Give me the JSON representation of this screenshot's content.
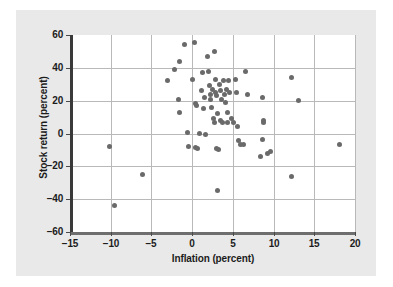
{
  "chart_data": {
    "type": "scatter",
    "title": "",
    "xlabel": "Inflation (percent)",
    "ylabel": "Stock return (percent)",
    "xlim": [
      -15,
      20
    ],
    "ylim": [
      -60,
      60
    ],
    "xticks": [
      -15,
      -10,
      -5,
      0,
      5,
      10,
      15,
      20
    ],
    "yticks": [
      -60,
      -40,
      -20,
      0,
      20,
      40,
      60
    ],
    "xtick_labels": [
      "−15",
      "−10",
      "−5",
      "0",
      "5",
      "10",
      "15",
      "20"
    ],
    "ytick_labels": [
      "60",
      "40",
      "20",
      "0",
      "−20",
      "−40",
      "−60"
    ],
    "grid": true,
    "legend": null,
    "marker_color": "#6a6a6a",
    "plot_background": "#ffffff",
    "figure_background": "#e9e9e9",
    "points": [
      [
        -10.1,
        -8
      ],
      [
        -9.5,
        -44
      ],
      [
        -6.1,
        -25
      ],
      [
        -3.0,
        32
      ],
      [
        -2.2,
        39
      ],
      [
        -1.6,
        44
      ],
      [
        -1.7,
        20.5
      ],
      [
        -1.5,
        13
      ],
      [
        -0.9,
        54
      ],
      [
        -0.6,
        0.5
      ],
      [
        -0.5,
        -8
      ],
      [
        0.1,
        33
      ],
      [
        0.3,
        55.5
      ],
      [
        0.4,
        18.5
      ],
      [
        0.5,
        17
      ],
      [
        0.4,
        -8.5
      ],
      [
        0.7,
        -9
      ],
      [
        0.9,
        0
      ],
      [
        1.1,
        26
      ],
      [
        1.3,
        37
      ],
      [
        1.5,
        22
      ],
      [
        1.4,
        15
      ],
      [
        1.6,
        -0.5
      ],
      [
        1.9,
        47
      ],
      [
        2.0,
        38
      ],
      [
        2.1,
        29
      ],
      [
        2.2,
        24
      ],
      [
        2.3,
        20.5
      ],
      [
        2.4,
        16
      ],
      [
        2.5,
        27
      ],
      [
        2.6,
        9
      ],
      [
        2.7,
        7
      ],
      [
        2.8,
        50
      ],
      [
        2.9,
        33
      ],
      [
        2.9,
        25
      ],
      [
        3.0,
        23
      ],
      [
        3.1,
        12
      ],
      [
        3.0,
        -9
      ],
      [
        3.2,
        -9.5
      ],
      [
        3.1,
        -35
      ],
      [
        3.4,
        30
      ],
      [
        3.5,
        26
      ],
      [
        3.6,
        21
      ],
      [
        3.5,
        8
      ],
      [
        3.7,
        6.5
      ],
      [
        3.9,
        32
      ],
      [
        4.0,
        24
      ],
      [
        4.1,
        19
      ],
      [
        4.2,
        27
      ],
      [
        4.3,
        13
      ],
      [
        4.4,
        7
      ],
      [
        4.5,
        32
      ],
      [
        4.6,
        25
      ],
      [
        4.8,
        9
      ],
      [
        5.1,
        7
      ],
      [
        5.3,
        33
      ],
      [
        5.5,
        25
      ],
      [
        5.6,
        4.5
      ],
      [
        5.7,
        -4
      ],
      [
        5.9,
        -7
      ],
      [
        6.3,
        -6.5
      ],
      [
        6.6,
        38
      ],
      [
        6.8,
        24
      ],
      [
        8.4,
        -14
      ],
      [
        8.6,
        22
      ],
      [
        8.8,
        8
      ],
      [
        8.8,
        6.5
      ],
      [
        8.7,
        -3.5
      ],
      [
        9.3,
        -12
      ],
      [
        9.6,
        -11
      ],
      [
        12.2,
        34
      ],
      [
        12.2,
        -26
      ],
      [
        13.0,
        20
      ],
      [
        18.1,
        -7
      ]
    ]
  }
}
